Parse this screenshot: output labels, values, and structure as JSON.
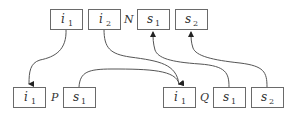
{
  "top_row": {
    "label": "N",
    "cells": [
      {
        "id": "N_i1",
        "base": "i",
        "sub": "1"
      },
      {
        "id": "N_i2",
        "base": "i",
        "sub": "2"
      },
      {
        "id": "N_s1",
        "base": "s",
        "sub": "1"
      },
      {
        "id": "N_s2",
        "base": "s",
        "sub": "2"
      }
    ]
  },
  "bottom_left": {
    "label": "P",
    "cells": [
      {
        "id": "P_i1",
        "base": "i",
        "sub": "1"
      },
      {
        "id": "P_s1",
        "base": "s",
        "sub": "1"
      }
    ]
  },
  "bottom_right": {
    "label": "Q",
    "cells": [
      {
        "id": "Q_i1",
        "base": "i",
        "sub": "1"
      },
      {
        "id": "Q_s1",
        "base": "s",
        "sub": "1"
      },
      {
        "id": "Q_s2",
        "base": "s",
        "sub": "2"
      }
    ]
  },
  "edges": [
    {
      "from": "N_i1",
      "to": "P_i1"
    },
    {
      "from": "N_i2",
      "to": "Q_i1"
    },
    {
      "from": "P_s1",
      "to": "Q_i1"
    },
    {
      "from": "Q_s1",
      "to": "N_s1"
    },
    {
      "from": "Q_s2",
      "to": "N_s2"
    }
  ]
}
